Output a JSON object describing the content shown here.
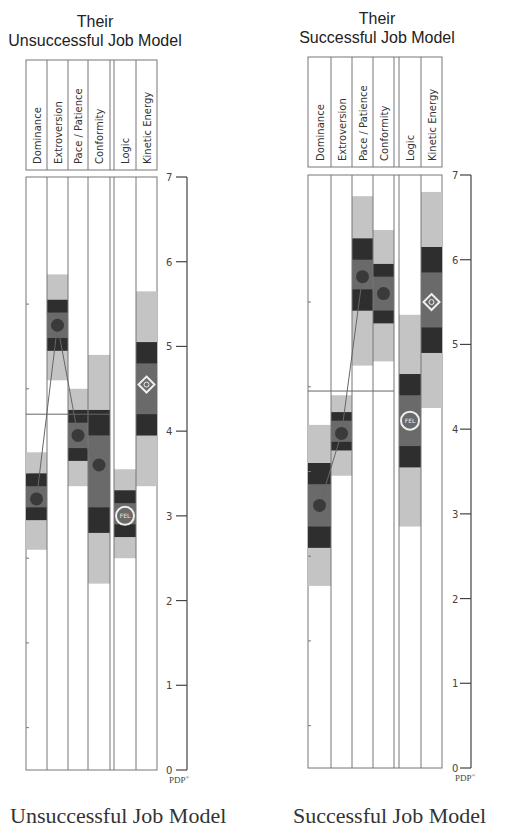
{
  "charts": {
    "left": {
      "title_line1": "Their",
      "title_line2": "Unsuccessful Job Model",
      "caption": "Unsuccessful Job Model",
      "axis_label": "PDP",
      "axis_sup": "®"
    },
    "right": {
      "title_line1": "Their",
      "title_line2": "Successful Job Model",
      "caption": "Successful Job Model",
      "axis_label": "PDP",
      "axis_sup": "®"
    }
  },
  "columns": [
    "Dominance",
    "Extroversion",
    "Pace / Patience",
    "Conformity",
    "Logic",
    "Kinetic Energy"
  ],
  "yticks": [
    "0",
    "1",
    "2",
    "3",
    "4",
    "5",
    "6",
    "7"
  ],
  "colors": {
    "light_band": "#c4c4c4",
    "dark_band": "#2e2e2e",
    "mid_band": "#6a6a6a",
    "dot": "#3a3a3a",
    "line": "#666666",
    "grid": "#777777"
  },
  "chart_data": [
    {
      "type": "table",
      "title": "Their Unsuccessful Job Model",
      "caption": "Unsuccessful Job Model",
      "categories": [
        "Dominance",
        "Extroversion",
        "Pace / Patience",
        "Conformity",
        "Logic",
        "Kinetic Energy"
      ],
      "ylabel": "PDP®",
      "ylim": [
        0,
        7
      ],
      "reference_line": 4.2,
      "series": [
        {
          "name": "Dominance",
          "score": 3.2,
          "light_range": [
            2.6,
            3.75
          ],
          "dark_upper": [
            3.35,
            3.5
          ],
          "dark_lower": [
            2.95,
            3.1
          ],
          "mid_range": [
            2.95,
            3.5
          ]
        },
        {
          "name": "Extroversion",
          "score": 5.25,
          "light_range": [
            4.6,
            5.85
          ],
          "dark_upper": [
            5.4,
            5.55
          ],
          "dark_lower": [
            4.95,
            5.1
          ],
          "mid_range": [
            4.95,
            5.55
          ]
        },
        {
          "name": "Pace / Patience",
          "score": 3.95,
          "light_range": [
            3.35,
            4.5
          ],
          "dark_upper": [
            4.1,
            4.25
          ],
          "dark_lower": [
            3.65,
            3.8
          ],
          "mid_range": [
            3.65,
            4.25
          ]
        },
        {
          "name": "Conformity",
          "score": 3.6,
          "light_range": [
            2.2,
            4.9
          ],
          "dark_upper": [
            3.95,
            4.25
          ],
          "dark_lower": [
            2.8,
            3.1
          ],
          "mid_range": [
            2.8,
            4.25
          ]
        },
        {
          "name": "Logic",
          "score": 3.0,
          "marker": "FEL",
          "light_range": [
            2.5,
            3.55
          ],
          "dark_upper": [
            3.15,
            3.3
          ],
          "dark_lower": [
            2.75,
            2.9
          ],
          "mid_range": [
            2.75,
            3.3
          ]
        },
        {
          "name": "Kinetic Energy",
          "score": 4.55,
          "marker": "diamond",
          "light_range": [
            3.35,
            5.65
          ],
          "dark_upper": [
            4.8,
            5.05
          ],
          "dark_lower": [
            3.95,
            4.2
          ],
          "mid_range": [
            3.95,
            5.05
          ]
        }
      ],
      "connected_scores": [
        3.2,
        5.25,
        3.95,
        3.6
      ]
    },
    {
      "type": "table",
      "title": "Their Successful Job Model",
      "caption": "Successful Job Model",
      "categories": [
        "Dominance",
        "Extroversion",
        "Pace / Patience",
        "Conformity",
        "Logic",
        "Kinetic Energy"
      ],
      "ylabel": "PDP®",
      "ylim": [
        0,
        7
      ],
      "reference_line": 4.45,
      "series": [
        {
          "name": "Dominance",
          "score": 3.1,
          "light_range": [
            2.15,
            4.05
          ],
          "dark_upper": [
            3.35,
            3.6
          ],
          "dark_lower": [
            2.6,
            2.85
          ],
          "mid_range": [
            2.6,
            3.6
          ]
        },
        {
          "name": "Extroversion",
          "score": 3.95,
          "light_range": [
            3.45,
            4.4
          ],
          "dark_upper": [
            4.1,
            4.2
          ],
          "dark_lower": [
            3.75,
            3.85
          ],
          "mid_range": [
            3.75,
            4.2
          ]
        },
        {
          "name": "Pace / Patience",
          "score": 5.8,
          "light_range": [
            4.75,
            6.75
          ],
          "dark_upper": [
            6.0,
            6.25
          ],
          "dark_lower": [
            5.4,
            5.65
          ],
          "mid_range": [
            5.4,
            6.25
          ]
        },
        {
          "name": "Conformity",
          "score": 5.6,
          "light_range": [
            4.8,
            6.35
          ],
          "dark_upper": [
            5.8,
            5.95
          ],
          "dark_lower": [
            5.25,
            5.4
          ],
          "mid_range": [
            5.25,
            5.95
          ]
        },
        {
          "name": "Logic",
          "score": 4.1,
          "marker": "FEL",
          "light_range": [
            2.85,
            5.35
          ],
          "dark_upper": [
            4.4,
            4.65
          ],
          "dark_lower": [
            3.55,
            3.8
          ],
          "mid_range": [
            3.55,
            4.65
          ]
        },
        {
          "name": "Kinetic Energy",
          "score": 5.5,
          "marker": "diamond",
          "light_range": [
            4.25,
            6.8
          ],
          "dark_upper": [
            5.85,
            6.15
          ],
          "dark_lower": [
            4.9,
            5.2
          ],
          "mid_range": [
            4.9,
            6.15
          ]
        }
      ],
      "connected_scores": [
        3.1,
        3.95,
        5.8
      ]
    }
  ]
}
